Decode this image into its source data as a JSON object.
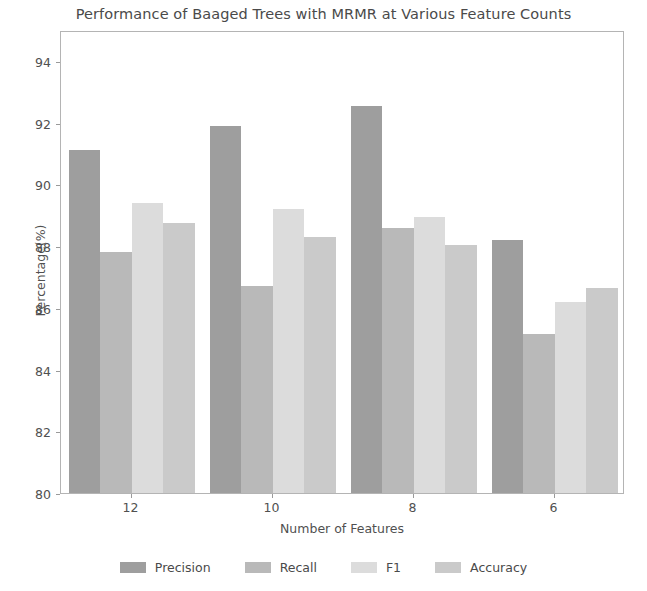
{
  "chart_data": {
    "type": "bar",
    "title": "Performance of Baaged Trees with MRMR at Various Feature Counts",
    "xlabel": "Number of Features",
    "ylabel": "Percentage(%)",
    "categories": [
      "12",
      "10",
      "8",
      "6"
    ],
    "ylim": [
      80,
      95
    ],
    "yticks": [
      80,
      82,
      84,
      86,
      88,
      90,
      92,
      94
    ],
    "grid": false,
    "legend_position": "bottom",
    "series": [
      {
        "name": "Precision",
        "color": "#9e9e9e",
        "values": [
          91.1,
          91.9,
          92.55,
          88.2
        ]
      },
      {
        "name": "Recall",
        "color": "#b9b9b9",
        "values": [
          87.8,
          86.7,
          88.6,
          85.15
        ]
      },
      {
        "name": "F1",
        "color": "#dcdcdc",
        "values": [
          89.4,
          89.2,
          88.95,
          86.2
        ]
      },
      {
        "name": "Accuracy",
        "color": "#cacaca",
        "values": [
          88.75,
          88.3,
          88.05,
          86.65
        ]
      }
    ]
  },
  "axes": {
    "ytick_labels": [
      "94",
      "92",
      "90",
      "88",
      "86",
      "84",
      "82",
      "80"
    ],
    "xtick_labels": [
      "12",
      "10",
      "8",
      "6"
    ]
  },
  "legend": {
    "items": [
      {
        "label": "Precision"
      },
      {
        "label": "Recall"
      },
      {
        "label": "F1"
      },
      {
        "label": "Accuracy"
      }
    ]
  }
}
